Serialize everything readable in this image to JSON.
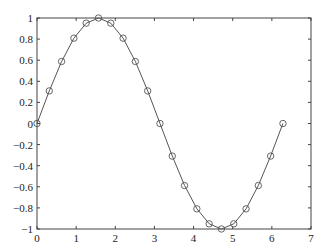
{
  "chart_data": {
    "type": "line",
    "title": "",
    "xlabel": "",
    "ylabel": "",
    "xlim": [
      0,
      7
    ],
    "ylim": [
      -1,
      1
    ],
    "grid": false,
    "legend": null,
    "xticks": [
      0,
      1,
      2,
      3,
      4,
      5,
      6,
      7
    ],
    "xtick_labels": [
      "0",
      "1",
      "2",
      "3",
      "4",
      "5",
      "6",
      "7"
    ],
    "yticks": [
      -1,
      -0.8,
      -0.6,
      -0.4,
      -0.2,
      0,
      0.2,
      0.4,
      0.6,
      0.8,
      1
    ],
    "ytick_labels": [
      "−1",
      "−0.8",
      "−0.6",
      "−0.4",
      "−0.2",
      "0",
      "0.2",
      "0.4",
      "0.6",
      "0.8",
      "1"
    ],
    "series": [
      {
        "name": "sin(x)",
        "marker": "circle",
        "line_color": "#555555",
        "x": [
          0,
          0.3142,
          0.6283,
          0.9425,
          1.2566,
          1.5708,
          1.885,
          2.1991,
          2.5133,
          2.8274,
          3.1416,
          3.4558,
          3.7699,
          4.0841,
          4.3982,
          4.7124,
          5.0265,
          5.3407,
          5.6549,
          5.969,
          6.2832
        ],
        "y": [
          0,
          0.309,
          0.5878,
          0.809,
          0.9511,
          1,
          0.9511,
          0.809,
          0.5878,
          0.309,
          0,
          -0.309,
          -0.5878,
          -0.809,
          -0.9511,
          -1,
          -0.9511,
          -0.809,
          -0.5878,
          -0.309,
          0
        ]
      }
    ]
  }
}
